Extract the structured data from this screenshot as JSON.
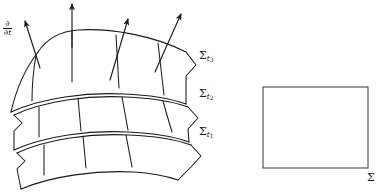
{
  "figure": {
    "background_color": "#ffffff",
    "stroke_color": "#1a1a1a",
    "labels": {
      "time_vector": {
        "symbol": "∂/∂t",
        "numerator": "∂",
        "denominator": "∂t"
      },
      "sigma_t3": {
        "base": "Σ",
        "sub_letter": "t",
        "sub_index": "3"
      },
      "sigma_t2": {
        "base": "Σ",
        "sub_letter": "t",
        "sub_index": "2"
      },
      "sigma_t1": {
        "base": "Σ",
        "sub_letter": "t",
        "sub_index": "1"
      },
      "sigma_plain": {
        "base": "Σ"
      }
    },
    "surfaces": [
      {
        "name": "sigma-t3",
        "role": "top-hypersurface"
      },
      {
        "name": "sigma-t2",
        "role": "middle-hypersurface"
      },
      {
        "name": "sigma-t1",
        "role": "bottom-hypersurface"
      }
    ],
    "arrows": [
      {
        "name": "time-arrow-1",
        "tilt": "left-leaning"
      },
      {
        "name": "time-arrow-2",
        "tilt": "vertical"
      },
      {
        "name": "time-arrow-3",
        "tilt": "right-leaning"
      },
      {
        "name": "time-arrow-4",
        "tilt": "right-leaning"
      }
    ],
    "rectangle": {
      "name": "flat-sigma-rectangle",
      "fill": "none"
    }
  }
}
